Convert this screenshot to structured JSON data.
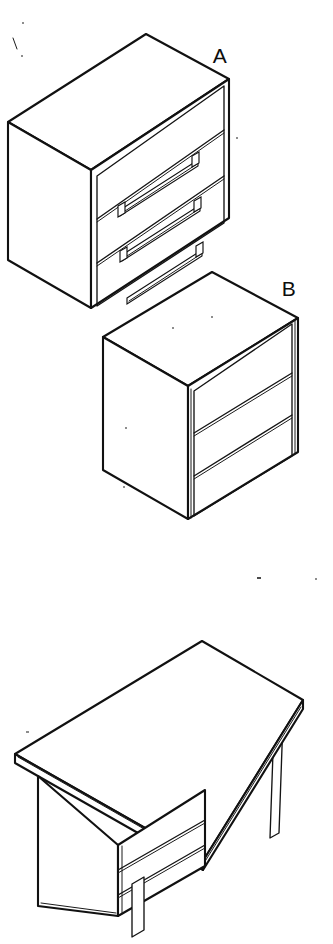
{
  "figure": {
    "width": 333,
    "height": 944,
    "background_color": "#ffffff",
    "line_color": "#111111",
    "style": "black-and-white technical isometric line art, no shading"
  },
  "labels": [
    {
      "id": "label-a",
      "text": "A",
      "x": 220,
      "y": 63,
      "refers_to": "three-drawer-chest-with-handles"
    },
    {
      "id": "label-b",
      "text": "B",
      "x": 289,
      "y": 296,
      "refers_to": "three-drawer-chest-no-handles"
    }
  ],
  "objects": [
    {
      "id": "chest-a",
      "name": "Three-drawer chest (A)",
      "type": "cabinet",
      "drawer_count": 3,
      "has_handles": true,
      "handle_style": "long horizontal pull bar with end stops",
      "handle_count": 3,
      "projection": "isometric",
      "visible_faces": [
        "top",
        "left-side",
        "front"
      ],
      "geometry": {
        "top_apex": [
          146,
          34
        ],
        "left_corner": [
          8,
          122
        ],
        "front_corner": [
          91,
          170
        ],
        "right_corner": [
          229,
          79
        ],
        "left_bottom": [
          8,
          260
        ],
        "front_bottom": [
          91,
          308
        ],
        "right_bottom": [
          229,
          218
        ],
        "drawer_divider_y_front": [
          170,
          216,
          262
        ],
        "frame_inset": 6
      }
    },
    {
      "id": "chest-b",
      "name": "Three-drawer chest (B)",
      "type": "cabinet",
      "drawer_count": 3,
      "has_handles": false,
      "handle_style": "none - plain drawer fronts",
      "handle_count": 0,
      "projection": "isometric",
      "visible_faces": [
        "top",
        "left-side",
        "front"
      ],
      "geometry": {
        "top_apex": [
          212,
          272
        ],
        "left_corner": [
          103,
          337
        ],
        "front_corner": [
          188,
          386
        ],
        "right_corner": [
          298,
          318
        ],
        "left_bottom": [
          103,
          470
        ],
        "front_bottom": [
          188,
          519
        ],
        "right_bottom": [
          298,
          452
        ],
        "drawer_divider_y_front": [
          386,
          430,
          475
        ],
        "frame_inset": 6
      }
    },
    {
      "id": "desk-c",
      "name": "Pedestal desk",
      "type": "desk",
      "drawer_count": 3,
      "has_handles": false,
      "leg_count": 3,
      "pedestal_side": "left",
      "projection": "isometric",
      "visible_faces": [
        "top",
        "pedestal-left-side",
        "pedestal-front"
      ],
      "geometry": {
        "top_back_apex": [
          202,
          641
        ],
        "top_left_corner": [
          15,
          754
        ],
        "top_front_apex": [
          203,
          870
        ],
        "top_right_corner": [
          303,
          700
        ],
        "top_thickness": 9,
        "pedestal_top_left": [
          38,
          776
        ],
        "pedestal_front_corner": [
          118,
          845
        ],
        "pedestal_right_edge_top": [
          205,
          790
        ],
        "pedestal_left_bottom": [
          38,
          906
        ],
        "pedestal_front_bottom": [
          118,
          916
        ],
        "pedestal_right_bottom": [
          205,
          866
        ],
        "drawer_divider_front_y": [
          845,
          872,
          898
        ],
        "legs": [
          {
            "id": "leg-pedestal",
            "x_top": 140,
            "y_top": 893,
            "x_bottom": 140,
            "y_bottom": 937,
            "width": 11
          },
          {
            "id": "leg-middle",
            "x_top": 211,
            "y_top": 760,
            "x_bottom": 208,
            "y_bottom": 810,
            "width": 8
          },
          {
            "id": "leg-right",
            "x_top": 274,
            "y_top": 724,
            "x_bottom": 270,
            "y_bottom": 838,
            "width": 9
          }
        ]
      }
    }
  ],
  "artifacts": [
    {
      "id": "speck-1",
      "x": 14,
      "y": 40,
      "w": 2,
      "h": 8,
      "kind": "scan-stroke"
    },
    {
      "id": "speck-2",
      "x": 22,
      "y": 22,
      "w": 2,
      "h": 2,
      "kind": "scan-dot"
    },
    {
      "id": "speck-3",
      "x": 21,
      "y": 55,
      "w": 2,
      "h": 2,
      "kind": "scan-dot"
    },
    {
      "id": "speck-4",
      "x": 236,
      "y": 137,
      "w": 2,
      "h": 2,
      "kind": "scan-dot"
    },
    {
      "id": "speck-5",
      "x": 257,
      "y": 577,
      "w": 4,
      "h": 2,
      "kind": "scan-dot"
    },
    {
      "id": "speck-6",
      "x": 315,
      "y": 578,
      "w": 2,
      "h": 2,
      "kind": "scan-dot"
    },
    {
      "id": "speck-7",
      "x": 172,
      "y": 327,
      "w": 2,
      "h": 2,
      "kind": "scan-dot"
    },
    {
      "id": "speck-8",
      "x": 125,
      "y": 427,
      "w": 2,
      "h": 2,
      "kind": "scan-dot"
    },
    {
      "id": "speck-9",
      "x": 123,
      "y": 486,
      "w": 2,
      "h": 2,
      "kind": "scan-dot"
    },
    {
      "id": "speck-10",
      "x": 26,
      "y": 731,
      "w": 3,
      "h": 2,
      "kind": "scan-dot"
    },
    {
      "id": "speck-11",
      "x": 211,
      "y": 316,
      "w": 2,
      "h": 2,
      "kind": "scan-dot"
    }
  ]
}
